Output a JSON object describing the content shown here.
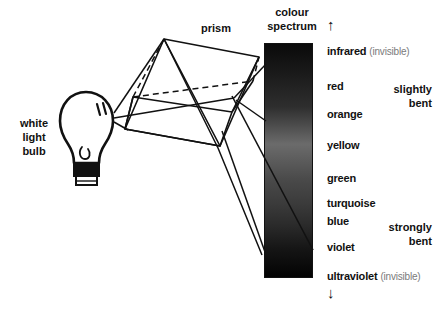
{
  "figure": {
    "width": 437,
    "height": 322,
    "background": "#ffffff",
    "ink": "#111111"
  },
  "titles": {
    "prism": "prism",
    "spectrum_line1": "colour",
    "spectrum_line2": "spectrum"
  },
  "source": {
    "line1": "white",
    "line2": "light",
    "line3": "bulb",
    "icon": "lightbulb-icon"
  },
  "arrows": {
    "up": "↑",
    "down": "↓",
    "up_name": "up-arrow-icon",
    "down_name": "down-arrow-icon"
  },
  "spectrum": {
    "x": 264,
    "y": 43,
    "width": 49,
    "height": 235,
    "border_color": "#111111",
    "bands": [
      {
        "name": "infrared",
        "color": "#0a0a0a",
        "stop": 0
      },
      {
        "name": "red",
        "color": "#1c1c1c",
        "stop": 14
      },
      {
        "name": "orange",
        "color": "#2e2e2e",
        "stop": 27
      },
      {
        "name": "yellow",
        "color": "#6b6b6b",
        "stop": 43
      },
      {
        "name": "green",
        "color": "#4a4a4a",
        "stop": 58
      },
      {
        "name": "turquoise",
        "color": "#3a3a3a",
        "stop": 69
      },
      {
        "name": "blue",
        "color": "#2a2a2a",
        "stop": 78
      },
      {
        "name": "violet",
        "color": "#151515",
        "stop": 88
      },
      {
        "name": "ultraviolet",
        "color": "#030303",
        "stop": 100
      }
    ]
  },
  "labels": [
    {
      "id": "infrared",
      "text": "infrared",
      "note": "(invisible)",
      "y": 45
    },
    {
      "id": "red",
      "text": "red",
      "note": "",
      "y": 80
    },
    {
      "id": "orange",
      "text": "orange",
      "note": "",
      "y": 108
    },
    {
      "id": "yellow",
      "text": "yellow",
      "note": "",
      "y": 139
    },
    {
      "id": "green",
      "text": "green",
      "note": "",
      "y": 172
    },
    {
      "id": "turquoise",
      "text": "turquoise",
      "note": "",
      "y": 197
    },
    {
      "id": "blue",
      "text": "blue",
      "note": "",
      "y": 215
    },
    {
      "id": "violet",
      "text": "violet",
      "note": "",
      "y": 241
    },
    {
      "id": "ultraviolet",
      "text": "ultraviolet",
      "note": "(invisible)",
      "y": 270
    }
  ],
  "bending": {
    "slightly_line1": "slightly",
    "slightly_line2": "bent",
    "strongly_line1": "strongly",
    "strongly_line2": "bent"
  }
}
